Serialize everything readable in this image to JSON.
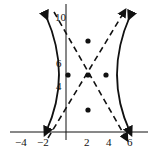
{
  "diagram": {
    "type": "hyperbola-graph",
    "center": [
      2,
      5
    ],
    "vertices": [
      [
        0,
        5
      ],
      [
        4,
        5
      ]
    ],
    "marked_points": [
      [
        2,
        8
      ],
      [
        2,
        5
      ],
      [
        2,
        2
      ],
      [
        0,
        5
      ],
      [
        4,
        5
      ]
    ],
    "asymptotes": "dashed",
    "x_ticks": [
      "-4",
      "-2",
      "2",
      "4",
      "6"
    ],
    "y_ticks": [
      "4",
      "6",
      "10"
    ],
    "colors": {
      "curve": "#111111",
      "axis": "#111111",
      "background": "#ffffff"
    }
  },
  "labels": {
    "x_neg4": "−4",
    "x_neg2": "−2",
    "x_2": "2",
    "x_4": "4",
    "x_6": "6",
    "y_4": "4",
    "y_6": "6",
    "y_10": "10"
  }
}
